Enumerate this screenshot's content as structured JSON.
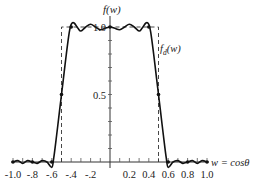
{
  "chart_data": {
    "type": "line",
    "title": "",
    "xlabel": "w = cosθ",
    "ylabel": "f(w)",
    "xlim": [
      -1.0,
      1.0
    ],
    "ylim": [
      0,
      1.0
    ],
    "grid": false,
    "x_tick_labels": [
      "-1.0",
      "-.8",
      "-.6",
      "-.4",
      "-.2",
      "0.2",
      "0.4",
      "0.6",
      "0.8",
      "1.0"
    ],
    "x_tick_values": [
      -1.0,
      -0.8,
      -0.6,
      -0.4,
      -0.2,
      0.2,
      0.4,
      0.6,
      0.8,
      1.0
    ],
    "y_tick_labels": [
      "0.5",
      "1.0"
    ],
    "y_tick_values": [
      0.5,
      1.0
    ],
    "series": [
      {
        "name": "f(w)",
        "style": "solid",
        "x": [
          -1.0,
          -0.95,
          -0.9,
          -0.85,
          -0.8,
          -0.75,
          -0.7,
          -0.65,
          -0.6,
          -0.58,
          -0.55,
          -0.52,
          -0.5,
          -0.48,
          -0.45,
          -0.42,
          -0.4,
          -0.37,
          -0.33,
          -0.3,
          -0.25,
          -0.2,
          -0.15,
          -0.1,
          -0.05,
          0.0,
          0.05,
          0.1,
          0.15,
          0.2,
          0.25,
          0.3,
          0.33,
          0.37,
          0.4,
          0.42,
          0.45,
          0.48,
          0.5,
          0.52,
          0.55,
          0.58,
          0.6,
          0.65,
          0.7,
          0.75,
          0.8,
          0.85,
          0.9,
          0.95,
          1.0
        ],
        "y": [
          0.0,
          0.01,
          -0.01,
          0.01,
          0.0,
          -0.01,
          0.01,
          0.0,
          -0.04,
          0.03,
          0.2,
          0.38,
          0.5,
          0.62,
          0.8,
          0.96,
          1.02,
          1.03,
          0.99,
          0.97,
          1.0,
          1.02,
          1.0,
          0.98,
          0.99,
          1.0,
          0.99,
          0.98,
          1.0,
          1.02,
          1.0,
          0.97,
          0.99,
          1.03,
          1.02,
          0.96,
          0.8,
          0.62,
          0.5,
          0.38,
          0.2,
          0.03,
          -0.04,
          0.0,
          0.01,
          -0.01,
          0.0,
          0.01,
          -0.01,
          0.01,
          0.0
        ]
      },
      {
        "name": "f_d(w)",
        "style": "dashed",
        "x": [
          -0.5,
          -0.5,
          0.5,
          0.5
        ],
        "y": [
          0.0,
          1.0,
          1.0,
          0.0
        ]
      }
    ],
    "markers": [
      {
        "x": -0.5,
        "y": 0.5
      },
      {
        "x": 0.5,
        "y": 0.5
      },
      {
        "x": -0.4,
        "y": 1.0
      },
      {
        "x": 0.4,
        "y": 1.0
      },
      {
        "x": 0.0,
        "y": 1.0
      },
      {
        "x": -0.6,
        "y": 0.0
      },
      {
        "x": 0.6,
        "y": 0.0
      },
      {
        "x": -0.8,
        "y": 0.0
      },
      {
        "x": 0.8,
        "y": 0.0
      },
      {
        "x": -1.0,
        "y": 0.0
      },
      {
        "x": 1.0,
        "y": 0.0
      }
    ],
    "annotations": [
      {
        "text": "f_d(w)",
        "near": "right dashed line, upper"
      },
      {
        "text": "w = cosθ",
        "near": "right end of x-axis"
      },
      {
        "text": "f(w)",
        "near": "top of y-axis"
      }
    ]
  },
  "labels": {
    "y_axis": "f(w)",
    "x_axis": "w = cosθ",
    "desired": "f",
    "desired_sub": "d",
    "desired_arg": "(w)"
  }
}
